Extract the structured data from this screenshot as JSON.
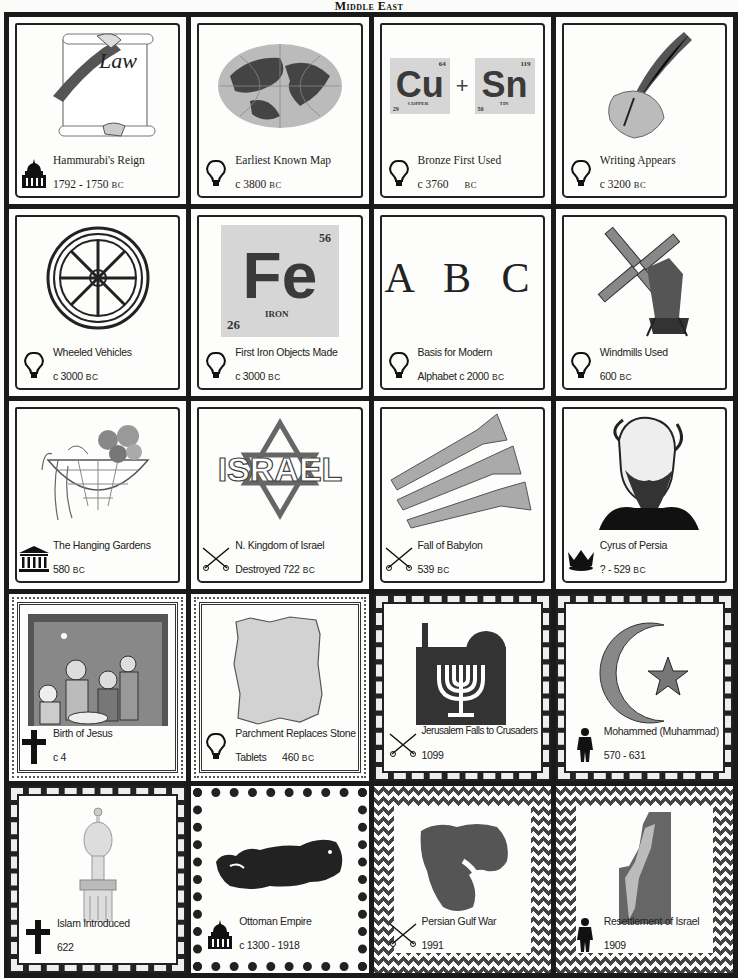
{
  "page": {
    "title": "Middle East"
  },
  "cards": [
    {
      "title": "Hammurabi's Reign",
      "date": "1792 - 1750",
      "era": "BC",
      "icon": "government-building-icon",
      "illustration": "law-scroll",
      "illustration_text": "Law"
    },
    {
      "title": "Earliest Known Map",
      "date": "c 3800",
      "era": "BC",
      "icon": "lightbulb-icon",
      "illustration": "globe"
    },
    {
      "title": "Bronze First Used",
      "date": "c 3760",
      "era": "BC",
      "icon": "lightbulb-icon",
      "illustration": "element-tiles",
      "elements": [
        {
          "symbol": "Cu",
          "name": "COPPER",
          "number": "29",
          "mass": "64"
        },
        {
          "symbol": "Sn",
          "name": "TIN",
          "number": "50",
          "mass": "119"
        }
      ],
      "operator": "+"
    },
    {
      "title": "Writing Appears",
      "date": "c 3200",
      "era": "BC",
      "icon": "lightbulb-icon",
      "illustration": "quill-hand"
    },
    {
      "title": "Wheeled Vehicles",
      "date": "c 3000",
      "era": "BC",
      "icon": "lightbulb-icon",
      "illustration": "wheel"
    },
    {
      "title": "First Iron Objects Made",
      "date": "c 3000",
      "era": "BC",
      "icon": "lightbulb-icon",
      "illustration": "element-tile",
      "elements": [
        {
          "symbol": "Fe",
          "name": "IRON",
          "number": "26",
          "mass": "56"
        }
      ]
    },
    {
      "title": "Basis for Modern",
      "date": "Alphabet c 2000",
      "era": "BC",
      "icon": "lightbulb-icon",
      "illustration": "letters",
      "illustration_text": "A B C"
    },
    {
      "title": "Windmills Used",
      "date": "600",
      "era": "BC",
      "icon": "lightbulb-icon",
      "illustration": "windmill"
    },
    {
      "title": "The Hanging Gardens",
      "date": "580",
      "era": "BC",
      "icon": "temple-icon",
      "illustration": "hanging-basket"
    },
    {
      "title": "N. Kingdom of Israel",
      "date": "Destroyed 722",
      "era": "BC",
      "icon": "crossed-swords-icon",
      "illustration": "israel-star",
      "illustration_text": "ISRAEL"
    },
    {
      "title": "Fall of Babylon",
      "date": "539",
      "era": "BC",
      "icon": "crossed-swords-icon",
      "illustration": "trumpets"
    },
    {
      "title": "Cyrus of Persia",
      "date": "? - 529",
      "era": "BC",
      "icon": "crown-icon",
      "illustration": "portrait"
    },
    {
      "title": "Birth of Jesus",
      "date": "c 4",
      "era": "",
      "icon": "cross-icon",
      "illustration": "nativity"
    },
    {
      "title": "Parchment Replaces Stone",
      "date": "Tablets      460",
      "era": "BC",
      "icon": "lightbulb-icon",
      "illustration": "parchment"
    },
    {
      "title": "Jerusalem Falls to Crusaders",
      "date": "1099",
      "era": "",
      "icon": "crossed-swords-icon",
      "illustration": "menorah-skyline"
    },
    {
      "title": "Mohammed (Muhammad)",
      "date": "570 - 631",
      "era": "",
      "icon": "person-icon",
      "illustration": "crescent-star"
    },
    {
      "title": "Islam Introduced",
      "date": "622",
      "era": "",
      "icon": "cross-icon",
      "illustration": "minaret"
    },
    {
      "title": "Ottoman Empire",
      "date": "c 1300 - 1918",
      "era": "",
      "icon": "government-building-icon",
      "illustration": "turkey-map"
    },
    {
      "title": "Persian Gulf War",
      "date": "1991",
      "era": "",
      "icon": "crossed-swords-icon",
      "illustration": "middle-east-map"
    },
    {
      "title": "Resettlement of Israel",
      "date": "1909",
      "era": "",
      "icon": "person-icon",
      "illustration": "israel-map"
    }
  ]
}
